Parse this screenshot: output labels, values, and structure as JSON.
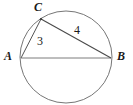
{
  "figure": {
    "kind": "inscribed-right-triangle-in-circle",
    "background_color": "#ffffff",
    "stroke_color": "#555555",
    "text_color": "#1a1a1a",
    "circle": {
      "name": "circumscribed-circle",
      "cx": 66,
      "cy": 57,
      "r": 46
    },
    "vertices": [
      {
        "id": "A",
        "label": "A",
        "x": 21,
        "y": 58
      },
      {
        "id": "B",
        "label": "B",
        "x": 111,
        "y": 58
      },
      {
        "id": "C",
        "label": "C",
        "x": 41,
        "y": 19
      }
    ],
    "segments": [
      {
        "id": "AB",
        "from": "A",
        "to": "B",
        "label": "",
        "x1": 21,
        "y1": 58,
        "x2": 111,
        "y2": 58
      },
      {
        "id": "AC",
        "from": "A",
        "to": "C",
        "label": "3",
        "x1": 21,
        "y1": 58,
        "x2": 41,
        "y2": 19
      },
      {
        "id": "CB",
        "from": "C",
        "to": "B",
        "label": "4",
        "x1": 41,
        "y1": 19,
        "x2": 111,
        "y2": 58
      }
    ],
    "labels": {
      "vertex_a": "A",
      "vertex_b": "B",
      "vertex_c": "C",
      "side_ac": "3",
      "side_cb": "4"
    }
  }
}
